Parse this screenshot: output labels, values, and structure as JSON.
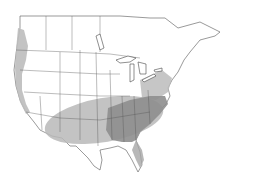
{
  "map": {
    "type": "species-range-map",
    "region": "North America (contiguous US and southern Canada)",
    "background_color": "#ffffff",
    "border_color": "#444444",
    "land_color": "#ffffff",
    "legend": [
      {
        "label": "range (light)",
        "color": "#b8b8b8"
      },
      {
        "label": "range (dark core)",
        "color": "#8c8c8c"
      }
    ],
    "shaded_regions": [
      {
        "name": "pacific-coast-range",
        "shade": "light"
      },
      {
        "name": "south-central-range",
        "shade": "light"
      },
      {
        "name": "southeast-core-range",
        "shade": "dark"
      },
      {
        "name": "mid-atlantic-range",
        "shade": "light"
      }
    ]
  }
}
